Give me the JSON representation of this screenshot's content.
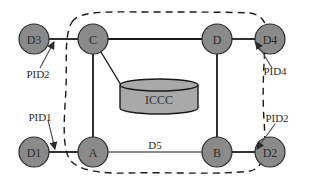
{
  "diagram": {
    "colors": {
      "node_fill": "#8a8a8a",
      "node_stroke": "#2b2b2b",
      "edge": "#1a1a1a",
      "cylinder_fill": "#a9a9a9",
      "boundary": "#1a1a1a",
      "arrow": "#555555",
      "background": "#ffffff"
    },
    "nodes": {
      "D3": "D3",
      "C": "C",
      "D": "D",
      "D4": "D4",
      "D1": "D1",
      "A": "A",
      "B": "B",
      "D2": "D2"
    },
    "database": {
      "label": "ICCC"
    },
    "edge_labels": {
      "A_B": "D5"
    },
    "annotations": {
      "pid_d3_c": "PID2",
      "pid_d_d4": "PID4",
      "pid_d1_a": "PID1",
      "pid_b_d2": "PID2"
    },
    "edges": [
      [
        "D3",
        "C"
      ],
      [
        "C",
        "D"
      ],
      [
        "D",
        "D4"
      ],
      [
        "D1",
        "A"
      ],
      [
        "A",
        "B"
      ],
      [
        "B",
        "D2"
      ],
      [
        "C",
        "A"
      ],
      [
        "D",
        "B"
      ],
      [
        "C",
        "ICCC"
      ]
    ],
    "boundary": "dashed closed region enclosing C, D, A, B and ICCC"
  }
}
